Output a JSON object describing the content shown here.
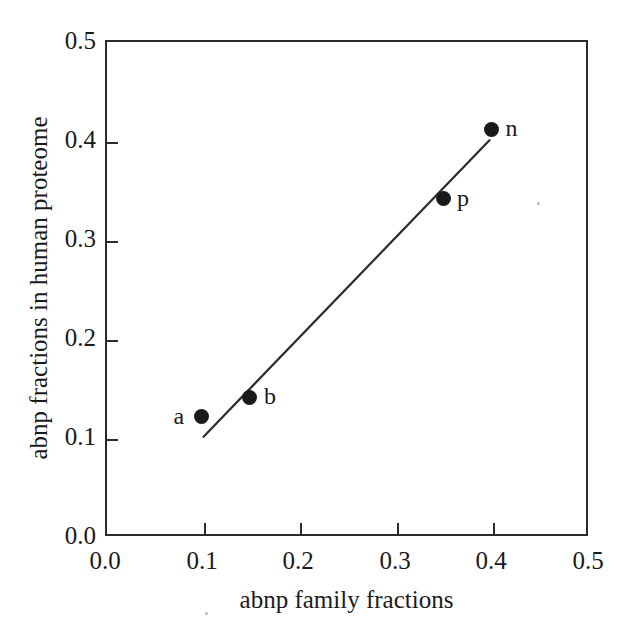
{
  "chart_data": {
    "type": "scatter",
    "title": "",
    "xlabel": "abnp family fractions",
    "ylabel": "abnp fractions in human proteome",
    "xlim": [
      0.0,
      0.5
    ],
    "ylim": [
      0.0,
      0.5
    ],
    "xticks": [
      "0.0",
      "0.1",
      "0.2",
      "0.3",
      "0.4",
      "0.5"
    ],
    "xtick_values": [
      0.0,
      0.1,
      0.2,
      0.3,
      0.4,
      0.5
    ],
    "yticks": [
      "0.0",
      "0.1",
      "0.2",
      "0.3",
      "0.4",
      "0.5"
    ],
    "ytick_values": [
      0.0,
      0.1,
      0.2,
      0.3,
      0.4,
      0.5
    ],
    "grid": false,
    "legend": "none",
    "marker_color": "#1a1a1a",
    "line_color": "#2b2b2b",
    "axis_color": "#2b2b2b",
    "background": "#ffffff",
    "points": [
      {
        "label": "a",
        "x": 0.1,
        "y": 0.12,
        "label_side": "left"
      },
      {
        "label": "b",
        "x": 0.15,
        "y": 0.14,
        "label_side": "right"
      },
      {
        "label": "p",
        "x": 0.35,
        "y": 0.34,
        "label_side": "right"
      },
      {
        "label": "n",
        "x": 0.4,
        "y": 0.41,
        "label_side": "right"
      }
    ],
    "trendline": {
      "x0": 0.102,
      "y0": 0.1,
      "x1": 0.398,
      "y1": 0.399
    }
  },
  "axes": {
    "x": {
      "label": "abnp family fractions",
      "tick_labels": [
        "0.0",
        "0.1",
        "0.2",
        "0.3",
        "0.4",
        "0.5"
      ]
    },
    "y": {
      "label": "abnp fractions in human proteome",
      "tick_labels": [
        "0.0",
        "0.1",
        "0.2",
        "0.3",
        "0.4",
        "0.5"
      ]
    }
  },
  "point_labels": {
    "a": "a",
    "b": "b",
    "p": "p",
    "n": "n"
  }
}
